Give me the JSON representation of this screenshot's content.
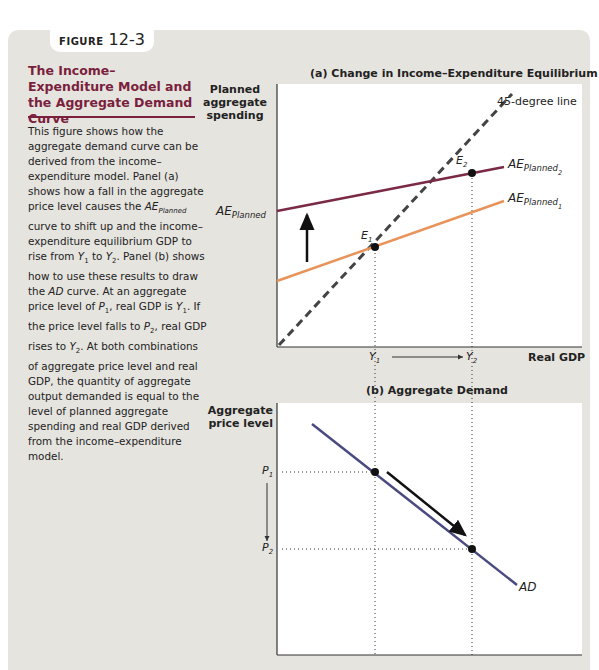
{
  "figure": {
    "label": "FIGURE",
    "number": "12-3",
    "title": "The Income–Expenditure Model and the Aggregate Demand Curve",
    "description_parts": [
      "This figure shows how the aggregate demand curve can be derived from the income–expenditure model. Panel (a) shows how a fall in the aggregate price level causes the ",
      "AE",
      "Planned",
      " curve to shift up and the income–expenditure equilibrium GDP to rise from ",
      "Y",
      "1",
      " to ",
      "Y",
      "2",
      ". Panel (b) shows how to use these results to draw the ",
      "AD",
      " curve. At an aggregate price level of ",
      "P",
      "1",
      ", real GDP is ",
      "Y",
      "1",
      ". If the price level falls to ",
      "P",
      "2",
      ", real GDP rises to ",
      "Y",
      "2",
      ". At both combinations of aggregate price level and real GDP, the quantity of aggregate output demanded is equal to the level of planned aggregate spending and real GDP derived from the income–expenditure model."
    ]
  },
  "panel_a": {
    "title": "(a) Change in Income–Expenditure Equilibrium",
    "y_axis_label_lines": [
      "Planned",
      "aggregate",
      "spending"
    ],
    "x_axis_label": "Real GDP",
    "line_45_label": "45-degree line",
    "ae_intercept_label_main": "AE",
    "ae_intercept_label_sub": "Planned",
    "ae1_label_main": "AE",
    "ae1_label_sub": "Planned",
    "ae1_label_subsub": "1",
    "ae2_label_main": "AE",
    "ae2_label_sub": "Planned",
    "ae2_label_subsub": "2",
    "e1_main": "E",
    "e1_sub": "1",
    "e2_main": "E",
    "e2_sub": "2",
    "y1_main": "Y",
    "y1_sub": "1",
    "y2_main": "Y",
    "y2_sub": "2",
    "colors": {
      "ae1": "#e8935a",
      "ae2": "#7a2a45",
      "line45": "#444444"
    }
  },
  "panel_b": {
    "title": "(b) Aggregate Demand",
    "y_axis_label_lines": [
      "Aggregate",
      "price level"
    ],
    "ad_label": "AD",
    "p1_main": "P",
    "p1_sub": "1",
    "p2_main": "P",
    "p2_sub": "2",
    "colors": {
      "ad": "#4a4a80"
    }
  },
  "colors": {
    "panel_bg": "#e6e4df",
    "title": "#7a1f3d"
  }
}
